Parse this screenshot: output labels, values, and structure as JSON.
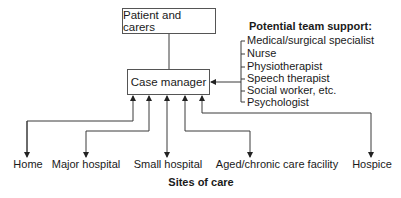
{
  "diagram": {
    "patient_box": "Patient and carers",
    "case_manager_box": "Case manager",
    "team_support": {
      "title": "Potential team support:",
      "items": [
        "Medical/surgical specialist",
        "Nurse",
        "Physiotherapist",
        "Speech therapist",
        "Social worker, etc.",
        "Psychologist"
      ]
    },
    "sites": {
      "title": "Sites of care",
      "items": [
        "Home",
        "Major hospital",
        "Small hospital",
        "Aged/chronic care facility",
        "Hospice"
      ]
    },
    "colors": {
      "line": "#3a3a3a",
      "text": "#1a1a1a",
      "background": "#ffffff"
    }
  }
}
